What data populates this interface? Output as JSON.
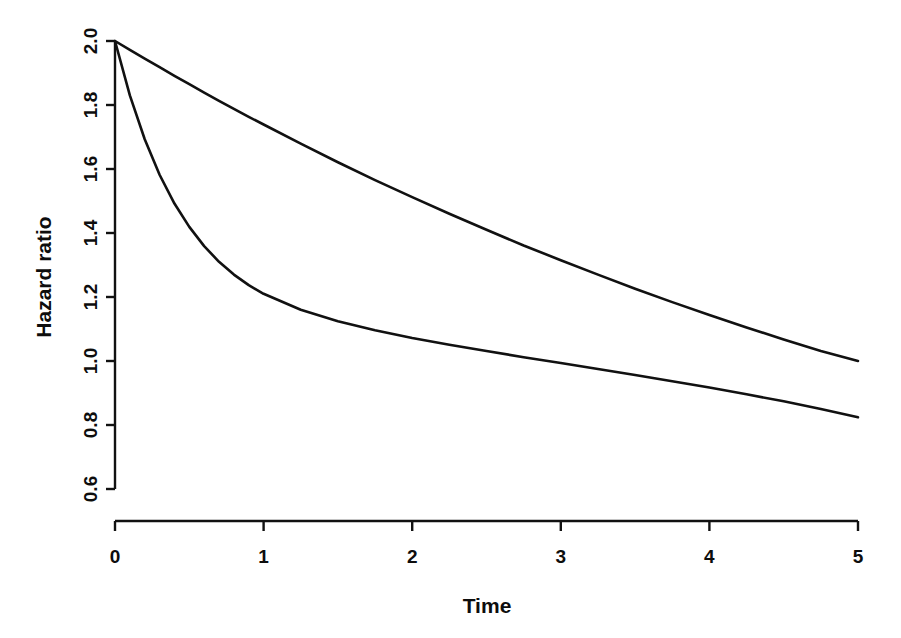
{
  "chart_data": {
    "type": "line",
    "title": "",
    "subtitle": "",
    "xlabel": "Time",
    "ylabel": "Hazard ratio",
    "xlim": [
      0,
      5
    ],
    "ylim": [
      0.555,
      2.0
    ],
    "grid": false,
    "legend": "none",
    "background": "#ffffff",
    "line_color": "#111111",
    "x_ticks": [
      0,
      1,
      2,
      3,
      4,
      5
    ],
    "x_tick_labels": [
      "0",
      "1",
      "2",
      "3",
      "4",
      "5"
    ],
    "y_ticks": [
      0.6,
      0.8,
      1.0,
      1.2,
      1.4,
      1.6,
      1.8,
      2.0
    ],
    "y_tick_labels": [
      "0.6",
      "0.8",
      "1.0",
      "1.2",
      "1.4",
      "1.6",
      "1.8",
      "2.0"
    ],
    "x": [
      0,
      0.1,
      0.2,
      0.3,
      0.4,
      0.5,
      0.6,
      0.7,
      0.8,
      0.9,
      1,
      1.25,
      1.5,
      1.75,
      2,
      2.25,
      2.5,
      2.75,
      3,
      3.25,
      3.5,
      3.75,
      4,
      4.25,
      4.5,
      4.75,
      5
    ],
    "series": [
      {
        "name": "slow-decay-curve",
        "values": [
          2.0,
          1.972,
          1.945,
          1.918,
          1.891,
          1.865,
          1.839,
          1.813,
          1.788,
          1.763,
          1.739,
          1.679,
          1.621,
          1.565,
          1.512,
          1.46,
          1.41,
          1.361,
          1.315,
          1.27,
          1.226,
          1.184,
          1.144,
          1.105,
          1.067,
          1.031,
          1.0
        ]
      },
      {
        "name": "fast-decay-curve",
        "values": [
          2.0,
          1.83,
          1.693,
          1.582,
          1.492,
          1.419,
          1.359,
          1.31,
          1.27,
          1.237,
          1.21,
          1.16,
          1.124,
          1.096,
          1.072,
          1.051,
          1.031,
          1.012,
          0.994,
          0.975,
          0.956,
          0.937,
          0.917,
          0.896,
          0.874,
          0.85,
          0.824
        ]
      }
    ]
  },
  "axes": {
    "x_axis_name": "Time",
    "y_axis_name": "Hazard ratio"
  }
}
